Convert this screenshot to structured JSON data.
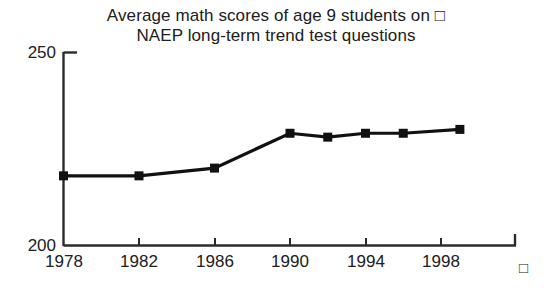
{
  "chart_data": {
    "type": "line",
    "title": "Average math scores of age 9 students on □ NAEP long-term trend test questions",
    "title_lines": [
      "Average math scores of age 9 students on □",
      "NAEP long-term trend test questions"
    ],
    "xlabel": "",
    "ylabel": "",
    "x": [
      1978,
      1982,
      1986,
      1990,
      1992,
      1994,
      1996,
      1999
    ],
    "values": [
      218,
      218,
      220,
      229,
      228,
      229,
      229,
      230
    ],
    "series": [
      {
        "name": "Average math score, age 9",
        "values": [
          218,
          218,
          220,
          229,
          228,
          229,
          229,
          230
        ]
      }
    ],
    "xlim": [
      1978,
      2001
    ],
    "ylim": [
      200,
      250
    ],
    "xtick_labels": [
      "1978",
      "1982",
      "1986",
      "1990",
      "1994",
      "1998"
    ],
    "xtick_values": [
      1978,
      1982,
      1986,
      1990,
      1994,
      1998
    ],
    "ytick_labels": [
      "200",
      "250"
    ],
    "ytick_values": [
      200,
      250
    ],
    "grid": false,
    "legend": false,
    "marker": "square",
    "line_color": "#111111",
    "marker_color": "#111111",
    "axis_color": "#2b2b2b",
    "background": "#ffffff",
    "axis_end_glyph": "□"
  },
  "axes": {
    "y_top_label": "250",
    "y_bottom_label": "200",
    "x_labels": [
      "1978",
      "1982",
      "1986",
      "1990",
      "1994",
      "1998"
    ],
    "right_glyph": "□"
  }
}
